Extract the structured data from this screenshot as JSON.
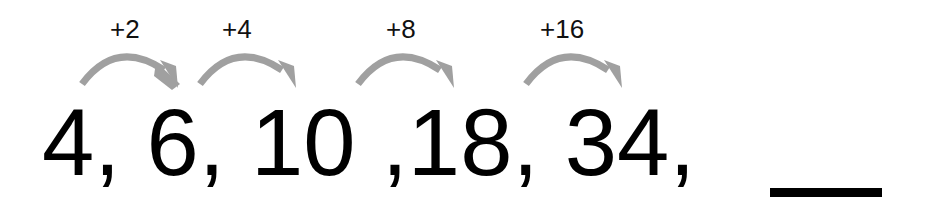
{
  "steps": [
    {
      "label": "+2"
    },
    {
      "label": "+4"
    },
    {
      "label": "+8"
    },
    {
      "label": "+16"
    }
  ],
  "sequence": {
    "terms": [
      "4,",
      "6,",
      "10",
      ",18,",
      "34,"
    ],
    "blank": "__"
  },
  "colors": {
    "arrow": "#a0a0a0",
    "text": "#000000"
  }
}
